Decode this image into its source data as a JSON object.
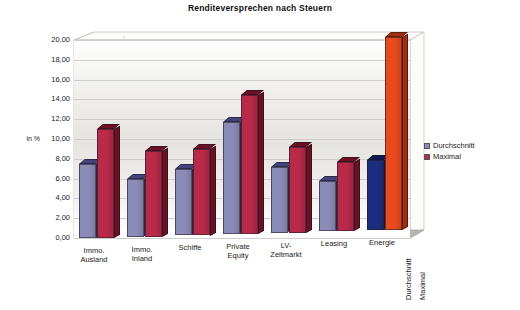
{
  "chart_data": {
    "type": "bar",
    "title": "Renditeversprechen nach Steuern",
    "xlabel": "",
    "ylabel": "in %",
    "ylim": [
      0,
      20
    ],
    "ytick_step": 2,
    "ytick_labels": [
      "0,00",
      "2,00",
      "4,00",
      "6,00",
      "8,00",
      "10,00",
      "12,00",
      "14,00",
      "16,00",
      "18,00",
      "20,00"
    ],
    "grid": true,
    "legend_position": "right",
    "categories": [
      "Immo. Ausland",
      "Immo. Inland",
      "Schiffe",
      "Private Equity",
      "LV-Zeitmarkt",
      "Leasing",
      "Energie"
    ],
    "series": [
      {
        "name": "Durchschnitt",
        "color": "#8b8bb8",
        "side_color": "#43437a",
        "values": [
          7.5,
          5.8,
          6.7,
          11.3,
          6.6,
          5.05,
          7.1
        ]
      },
      {
        "name": "Maximal",
        "color": "#b8294a",
        "side_color": "#6d1024",
        "values": [
          11.0,
          8.7,
          8.75,
          14.0,
          8.7,
          7.0,
          19.5
        ]
      }
    ],
    "highlight": {
      "category": "Energie",
      "durchschnitt_color": "#1d2d7d",
      "durchschnitt_side_color": "#111a52",
      "maximal_color": "#e8491d",
      "maximal_side_color": "#a52c0c"
    },
    "series_axis_labels": [
      "Durchschnitt",
      "Maximal"
    ]
  },
  "legend": {
    "items": [
      {
        "label": "Durchschnitt",
        "color": "#8b8bb8"
      },
      {
        "label": "Maximal",
        "color": "#b8294a"
      }
    ]
  }
}
